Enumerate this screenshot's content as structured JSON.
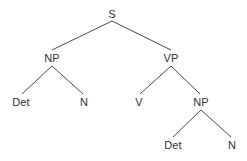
{
  "figure": {
    "background_color": "#ffffff",
    "edge_color": "#4a4a4a",
    "label_color": "#303030",
    "width": 247,
    "height": 161
  },
  "chart_data": {
    "type": "diagram",
    "diagram_kind": "constituency-parse-tree",
    "title": "",
    "nodes": [
      {
        "id": "S",
        "label": "S",
        "x": 112,
        "y": 14,
        "level": 0
      },
      {
        "id": "NP1",
        "label": "NP",
        "x": 52,
        "y": 58,
        "level": 1
      },
      {
        "id": "VP",
        "label": "VP",
        "x": 171,
        "y": 58,
        "level": 1
      },
      {
        "id": "Det1",
        "label": "Det",
        "x": 21,
        "y": 102,
        "level": 2
      },
      {
        "id": "N1",
        "label": "N",
        "x": 84,
        "y": 102,
        "level": 2
      },
      {
        "id": "V",
        "label": "V",
        "x": 139,
        "y": 102,
        "level": 2
      },
      {
        "id": "NP2",
        "label": "NP",
        "x": 201,
        "y": 102,
        "level": 2
      },
      {
        "id": "Det2",
        "label": "Det",
        "x": 173,
        "y": 145,
        "level": 3
      },
      {
        "id": "N2",
        "label": "N",
        "x": 232,
        "y": 145,
        "level": 3
      }
    ],
    "edges": [
      {
        "from": "S",
        "to": "NP1",
        "x1": 112,
        "y1": 21,
        "x2": 52,
        "y2": 50
      },
      {
        "from": "S",
        "to": "VP",
        "x1": 112,
        "y1": 21,
        "x2": 171,
        "y2": 50
      },
      {
        "from": "NP1",
        "to": "Det1",
        "x1": 52,
        "y1": 66,
        "x2": 22,
        "y2": 94
      },
      {
        "from": "NP1",
        "to": "N1",
        "x1": 52,
        "y1": 66,
        "x2": 83,
        "y2": 94
      },
      {
        "from": "VP",
        "to": "V",
        "x1": 171,
        "y1": 66,
        "x2": 140,
        "y2": 94
      },
      {
        "from": "VP",
        "to": "NP2",
        "x1": 171,
        "y1": 66,
        "x2": 200,
        "y2": 94
      },
      {
        "from": "NP2",
        "to": "Det2",
        "x1": 201,
        "y1": 110,
        "x2": 173,
        "y2": 137
      },
      {
        "from": "NP2",
        "to": "N2",
        "x1": 201,
        "y1": 110,
        "x2": 231,
        "y2": 137
      }
    ]
  }
}
